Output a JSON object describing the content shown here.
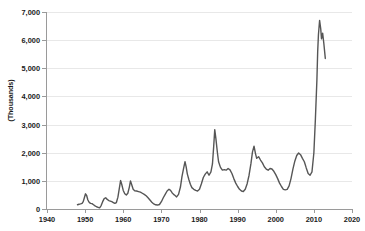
{
  "chart_data": {
    "type": "line",
    "title": "",
    "subtitle": "",
    "xlabel": "",
    "ylabel": "(Thousands)",
    "xlim": [
      1940,
      2020
    ],
    "ylim": [
      0,
      7000
    ],
    "grid": true,
    "legend": null,
    "legend_position": "none",
    "xticks": [
      1940,
      1950,
      1960,
      1970,
      1980,
      1990,
      2000,
      2010,
      2020
    ],
    "xtick_labels": [
      "1940",
      "1950",
      "1960",
      "1970",
      "1980",
      "1990",
      "2000",
      "2010",
      "2020"
    ],
    "yticks": [
      0,
      1000,
      2000,
      3000,
      4000,
      5000,
      6000,
      7000
    ],
    "ytick_labels": [
      "0",
      "1,000",
      "2,000",
      "3,000",
      "4,000",
      "5,000",
      "6,000",
      "7,000"
    ],
    "line_color": "#565656",
    "grid_color": "#e8e8e8",
    "axis_color": "#9a9a9a",
    "series": [
      {
        "name": "series-1",
        "x": [
          1948.0,
          1948.4,
          1948.8,
          1949.2,
          1949.5,
          1949.8,
          1950.1,
          1950.4,
          1950.7,
          1951.0,
          1951.4,
          1951.8,
          1952.2,
          1952.6,
          1953.0,
          1953.4,
          1953.8,
          1954.2,
          1954.6,
          1955.0,
          1955.4,
          1955.8,
          1956.2,
          1956.6,
          1957.0,
          1957.4,
          1957.8,
          1958.2,
          1958.6,
          1959.0,
          1959.3,
          1959.6,
          1960.0,
          1960.4,
          1960.8,
          1961.2,
          1961.6,
          1961.9,
          1962.2,
          1962.6,
          1963.0,
          1963.5,
          1964.0,
          1964.5,
          1965.0,
          1965.5,
          1966.0,
          1966.5,
          1967.0,
          1967.5,
          1968.0,
          1968.5,
          1969.0,
          1969.5,
          1970.0,
          1970.5,
          1971.0,
          1971.5,
          1972.0,
          1972.4,
          1972.8,
          1973.2,
          1973.6,
          1974.0,
          1974.5,
          1975.0,
          1975.4,
          1975.8,
          1976.2,
          1976.5,
          1976.8,
          1977.2,
          1977.6,
          1978.0,
          1978.5,
          1979.0,
          1979.5,
          1980.0,
          1980.5,
          1981.0,
          1981.5,
          1982.0,
          1982.5,
          1983.0,
          1983.4,
          1983.7,
          1984.0,
          1984.3,
          1984.7,
          1985.0,
          1985.5,
          1986.0,
          1986.5,
          1987.0,
          1987.5,
          1988.0,
          1988.5,
          1989.0,
          1989.5,
          1990.0,
          1990.5,
          1991.0,
          1991.5,
          1992.0,
          1992.5,
          1993.0,
          1993.5,
          1993.9,
          1994.3,
          1994.7,
          1995.0,
          1995.5,
          1996.0,
          1996.5,
          1997.0,
          1997.5,
          1998.0,
          1998.5,
          1999.0,
          1999.5,
          2000.0,
          2000.5,
          2001.0,
          2001.5,
          2002.0,
          2002.5,
          2003.0,
          2003.5,
          2004.0,
          2004.5,
          2005.0,
          2005.5,
          2006.0,
          2006.5,
          2007.0,
          2007.5,
          2008.0,
          2008.5,
          2009.0,
          2009.5,
          2010.0,
          2010.4,
          2010.8,
          2011.0,
          2011.2,
          2011.5,
          2011.8,
          2012.0,
          2012.3,
          2012.6,
          2013.0
        ],
        "y": [
          150,
          170,
          180,
          200,
          260,
          400,
          540,
          480,
          330,
          250,
          200,
          190,
          150,
          110,
          80,
          60,
          40,
          120,
          260,
          370,
          400,
          340,
          300,
          280,
          260,
          230,
          200,
          230,
          420,
          760,
          1010,
          880,
          660,
          540,
          500,
          560,
          780,
          1000,
          870,
          700,
          650,
          640,
          620,
          600,
          560,
          520,
          470,
          400,
          320,
          240,
          180,
          150,
          140,
          160,
          260,
          400,
          520,
          640,
          700,
          660,
          580,
          520,
          480,
          430,
          520,
          780,
          1150,
          1430,
          1680,
          1500,
          1250,
          1050,
          880,
          760,
          700,
          660,
          640,
          700,
          900,
          1120,
          1240,
          1320,
          1200,
          1320,
          1600,
          2180,
          2820,
          2500,
          2000,
          1680,
          1480,
          1380,
          1400,
          1380,
          1440,
          1390,
          1260,
          1080,
          920,
          800,
          700,
          640,
          620,
          700,
          900,
          1200,
          1620,
          2030,
          2230,
          1960,
          1800,
          1860,
          1740,
          1640,
          1500,
          1420,
          1380,
          1440,
          1420,
          1340,
          1220,
          1080,
          920,
          800,
          700,
          680,
          700,
          820,
          1080,
          1420,
          1700,
          1900,
          1990,
          1930,
          1800,
          1680,
          1460,
          1260,
          1200,
          1320,
          2000,
          3200,
          4600,
          5600,
          6200,
          6700,
          6400,
          6050,
          6250,
          5900,
          5350
        ]
      }
    ],
    "annotations": [],
    "notes": {
      "peak_value": 6700,
      "peak_year": 2011,
      "series_start_year": 1948,
      "series_end_year": 2013,
      "end_value": 5350
    }
  }
}
